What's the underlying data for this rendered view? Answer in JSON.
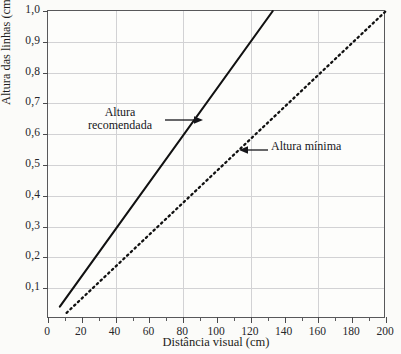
{
  "figure": {
    "background_color": "#fbfbf9",
    "plot_background_color": "#fdfdfb",
    "frame_color": "#58585a",
    "grid_color": "#d2d2d4",
    "line_color": "#111111"
  },
  "annotations": {
    "recommended": {
      "line1": "Altura",
      "line2": "recomendada",
      "arrow": "arrow-right"
    },
    "minimum": {
      "label": "Altura mínima",
      "arrow": "arrow-left"
    }
  },
  "chart_data": {
    "type": "line",
    "title": "",
    "xlabel": "Distância visual (cm)",
    "ylabel": "Altura das linhas (cm)",
    "xlim": [
      0,
      200
    ],
    "ylim": [
      0,
      1.0
    ],
    "grid": true,
    "legend_position": "inline-annotations",
    "xticks": [
      0,
      20,
      40,
      60,
      80,
      100,
      120,
      140,
      160,
      180,
      200
    ],
    "xticklabels": [
      "0",
      "20",
      "40",
      "60",
      "80",
      "100",
      "120",
      "140",
      "160",
      "180",
      "200"
    ],
    "xminor_ticks": [
      10,
      30,
      50,
      70,
      90,
      110,
      130,
      150,
      170,
      190
    ],
    "xgridlines": [
      40,
      80,
      120,
      160
    ],
    "yticks": [
      0.1,
      0.2,
      0.3,
      0.4,
      0.5,
      0.6,
      0.7,
      0.8,
      0.9,
      1.0
    ],
    "yticklabels": [
      "0,1",
      "0,2",
      "0,3",
      "0,4",
      "0,5",
      "0,6",
      "0,7",
      "0,8",
      "0,9",
      "1,0"
    ],
    "ygridlines": [
      0.1,
      0.2,
      0.3,
      0.4,
      0.5,
      0.6,
      0.7,
      0.8,
      0.9
    ],
    "series": [
      {
        "name": "Altura recomendada",
        "style": "solid",
        "color": "#111111",
        "x": [
          7,
          133
        ],
        "y": [
          0.04,
          1.0
        ]
      },
      {
        "name": "Altura mínima",
        "style": "dotted",
        "color": "#111111",
        "x": [
          11,
          200
        ],
        "y": [
          0.02,
          1.0
        ]
      }
    ]
  }
}
